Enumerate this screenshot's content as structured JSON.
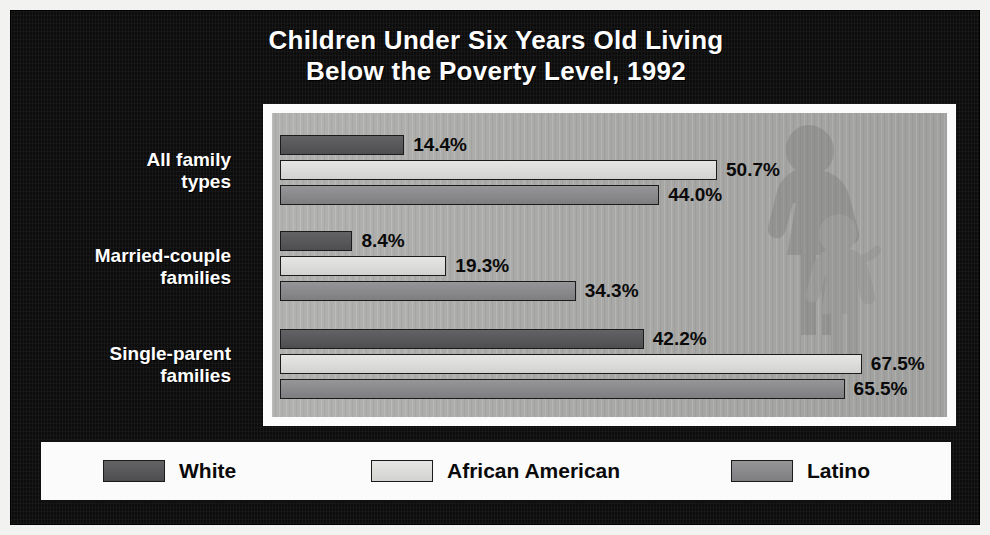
{
  "poster": {
    "title_line1": "Children Under Six Years Old Living",
    "title_line2": "Below the Poverty Level, 1992",
    "frame_color": "#0d0d0d",
    "title_color": "#ffffff",
    "plot_background": "#a9a9a7",
    "watermark": "mother-and-child-silhouette"
  },
  "chart_data": {
    "type": "bar",
    "orientation": "horizontal",
    "title": "Children Under Six Years Old Living Below the Poverty Level, 1992",
    "xlabel": "",
    "ylabel": "",
    "value_suffix": "%",
    "xlim": [
      0,
      75
    ],
    "grid": false,
    "legend_position": "bottom",
    "categories": [
      "All family types",
      "Married-couple families",
      "Single-parent families"
    ],
    "category_lines": [
      [
        "All family",
        "types"
      ],
      [
        "Married-couple",
        "families"
      ],
      [
        "Single-parent",
        "families"
      ]
    ],
    "series": [
      {
        "name": "White",
        "color": "#58585a",
        "values": [
          14.4,
          8.4,
          42.2
        ],
        "labels": [
          "14.4%",
          "8.4%",
          "42.2%"
        ]
      },
      {
        "name": "African American",
        "color": "#dcdcda",
        "values": [
          50.7,
          19.3,
          67.5
        ],
        "labels": [
          "50.7%",
          "19.3%",
          "67.5%"
        ]
      },
      {
        "name": "Latino",
        "color": "#8a8a8c",
        "values": [
          44.0,
          34.3,
          65.5
        ],
        "labels": [
          "44.0%",
          "34.3%",
          "65.5%"
        ]
      }
    ]
  },
  "legend": {
    "items": [
      {
        "label": "White",
        "swatch": "legend-swatch-white"
      },
      {
        "label": "African American",
        "swatch": "legend-swatch-african-american"
      },
      {
        "label": "Latino",
        "swatch": "legend-swatch-latino"
      }
    ]
  }
}
